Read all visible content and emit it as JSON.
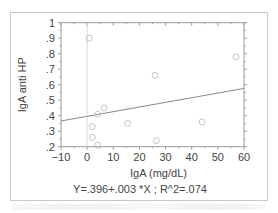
{
  "chart_data": {
    "type": "scatter",
    "title": "",
    "xlabel": "IgA (mg/dL)",
    "ylabel": "IgA anti HP",
    "xlim": [
      -10,
      60
    ],
    "ylim": [
      0.2,
      1.0
    ],
    "x_ticks": [
      "-10",
      "0",
      "10",
      "20",
      "30",
      "40",
      "50",
      "60"
    ],
    "y_ticks": [
      ".2",
      ".3",
      ".4",
      ".5",
      ".6",
      ".7",
      ".8",
      ".9",
      "1"
    ],
    "grid": false,
    "reference_line_x": 0,
    "series": [
      {
        "name": "observations",
        "marker": "open-circle",
        "points": [
          {
            "x": 0.8,
            "y": 0.9
          },
          {
            "x": 6.5,
            "y": 0.45
          },
          {
            "x": 4.0,
            "y": 0.41
          },
          {
            "x": 2.0,
            "y": 0.33
          },
          {
            "x": 2.0,
            "y": 0.26
          },
          {
            "x": 4.0,
            "y": 0.21
          },
          {
            "x": 15.5,
            "y": 0.35
          },
          {
            "x": 26.0,
            "y": 0.66
          },
          {
            "x": 26.5,
            "y": 0.24
          },
          {
            "x": 44.0,
            "y": 0.36
          },
          {
            "x": 57.0,
            "y": 0.78
          }
        ]
      }
    ],
    "regression": {
      "intercept": 0.396,
      "slope": 0.003,
      "r2": 0.074
    },
    "annotation": "Y=.396+.003 *X ; R^2=.074"
  }
}
